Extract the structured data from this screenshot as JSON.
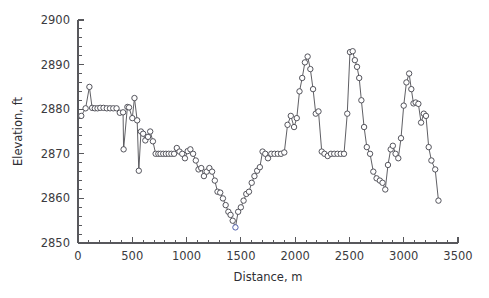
{
  "chart_data": {
    "type": "line",
    "title": "",
    "xlabel": "Distance,  m",
    "ylabel": "Elevation, ft",
    "xlim": [
      0,
      3500
    ],
    "ylim": [
      2850,
      2900
    ],
    "xticks": [
      0,
      500,
      1000,
      1500,
      2000,
      2500,
      3000,
      3500
    ],
    "yticks": [
      2850,
      2860,
      2870,
      2880,
      2890,
      2900
    ],
    "xtick_labels": [
      "0",
      "500",
      "1000",
      "1500",
      "2000",
      "2500",
      "3000",
      "3500"
    ],
    "ytick_labels": [
      "2850",
      "2860",
      "2870",
      "2880",
      "2890",
      "2900"
    ],
    "x_minor_interval": 100,
    "y_minor_interval": 2,
    "grid": false,
    "legend": null,
    "marker": "open-circle",
    "marker_color": "#ffffff",
    "marker_edge_color": "#4c4c54",
    "line_color": "#56565c",
    "highlight_marker_color": "#4a5aa8",
    "series": [
      {
        "name": "Elevation profile",
        "x": [
          30,
          70,
          105,
          130,
          155,
          180,
          205,
          235,
          265,
          295,
          325,
          355,
          385,
          415,
          420,
          455,
          470,
          500,
          520,
          545,
          560,
          580,
          600,
          620,
          645,
          665,
          690,
          715,
          740,
          760,
          785,
          810,
          835,
          860,
          885,
          910,
          935,
          960,
          985,
          1010,
          1035,
          1060,
          1085,
          1110,
          1135,
          1160,
          1185,
          1210,
          1235,
          1260,
          1285,
          1310,
          1335,
          1360,
          1385,
          1405,
          1425,
          1450,
          1475,
          1500,
          1525,
          1550,
          1575,
          1600,
          1625,
          1650,
          1675,
          1700,
          1725,
          1750,
          1780,
          1810,
          1840,
          1870,
          1900,
          1930,
          1960,
          1990,
          2015,
          2040,
          2065,
          2090,
          2115,
          2140,
          2165,
          2190,
          2215,
          2245,
          2270,
          2300,
          2330,
          2360,
          2390,
          2420,
          2450,
          2480,
          2505,
          2530,
          2550,
          2570,
          2590,
          2610,
          2635,
          2660,
          2690,
          2720,
          2750,
          2780,
          2805,
          2830,
          2855,
          2880,
          2900,
          2925,
          2950,
          2975,
          3000,
          3025,
          3050,
          3070,
          3090,
          3110,
          3135,
          3160,
          3185,
          3205,
          3230,
          3255,
          3290,
          3320
        ],
        "y": [
          2878.5,
          2880.2,
          2885.0,
          2880.3,
          2880.2,
          2880.2,
          2880.3,
          2880.3,
          2880.2,
          2880.2,
          2880.2,
          2880.2,
          2879.2,
          2879.3,
          2871.0,
          2880.5,
          2880.4,
          2878.0,
          2882.5,
          2877.5,
          2866.2,
          2875.0,
          2874.5,
          2873.0,
          2873.8,
          2875.0,
          2872.8,
          2870.0,
          2870.0,
          2870.0,
          2870.0,
          2870.0,
          2870.0,
          2870.0,
          2870.0,
          2871.3,
          2870.5,
          2870.0,
          2869.0,
          2870.6,
          2871.0,
          2870.0,
          2868.5,
          2866.5,
          2866.8,
          2865.0,
          2866.0,
          2866.8,
          2866.0,
          2864.0,
          2861.5,
          2861.3,
          2860.0,
          2858.5,
          2857.0,
          2856.3,
          2855.0,
          2853.5,
          2857.0,
          2858.0,
          2859.5,
          2861.0,
          2861.5,
          2863.5,
          2865.0,
          2866.2,
          2867.0,
          2870.5,
          2870.0,
          2869.0,
          2870.0,
          2870.0,
          2870.0,
          2870.0,
          2870.3,
          2876.5,
          2878.5,
          2876.0,
          2878.0,
          2884.0,
          2887.0,
          2890.5,
          2891.8,
          2889.0,
          2884.5,
          2879.0,
          2879.5,
          2870.5,
          2870.0,
          2869.5,
          2870.0,
          2870.0,
          2870.0,
          2870.0,
          2870.0,
          2879.0,
          2892.8,
          2893.0,
          2891.0,
          2889.5,
          2887.0,
          2882.0,
          2876.0,
          2871.5,
          2870.0,
          2866.0,
          2864.5,
          2864.0,
          2863.5,
          2862.0,
          2867.5,
          2871.0,
          2871.8,
          2870.0,
          2869.0,
          2873.5,
          2880.8,
          2886.0,
          2888.0,
          2884.5,
          2881.3,
          2881.5,
          2881.2,
          2877.0,
          2879.0,
          2878.5,
          2871.5,
          2868.5,
          2866.5,
          2859.5
        ]
      }
    ]
  },
  "axes": {
    "ylabel_text": "Elevation, ft",
    "xlabel_text": "Distance,  m"
  }
}
